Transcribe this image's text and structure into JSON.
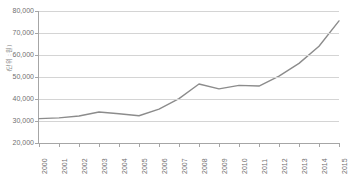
{
  "chart_data": {
    "type": "line",
    "title": "",
    "subtitle": "",
    "xlabel": "",
    "ylabel": "(단위 : 원)",
    "categories": [
      "2000",
      "2001",
      "2002",
      "2003",
      "2004",
      "2005",
      "2006",
      "2007",
      "2008",
      "2009",
      "2010",
      "2011",
      "2012",
      "2013",
      "2014",
      "2015"
    ],
    "values": [
      31100,
      31400,
      32300,
      34100,
      33300,
      32400,
      35400,
      40200,
      46800,
      44600,
      46200,
      45900,
      50400,
      56200,
      64000,
      75500
    ],
    "series": [
      {
        "name": "",
        "values": [
          31100,
          31400,
          32300,
          34100,
          33300,
          32400,
          35400,
          40200,
          46800,
          44600,
          46200,
          45900,
          50400,
          56200,
          64000,
          75500
        ]
      }
    ],
    "ylim": [
      20000,
      80000
    ],
    "y_ticks": [
      20000,
      30000,
      40000,
      50000,
      60000,
      70000,
      80000
    ],
    "y_tick_labels": [
      "20,000",
      "30,000",
      "40,000",
      "50,000",
      "60,000",
      "70,000",
      "80,000"
    ],
    "grid": true,
    "legend": false,
    "legend_position": "none",
    "line_color": "#8c8c8c",
    "grid_color": "#d4d4d4",
    "axis_color": "#a6a6a6",
    "tick_label_color": "#6f6f6f",
    "x_tick_rotation": -90
  }
}
